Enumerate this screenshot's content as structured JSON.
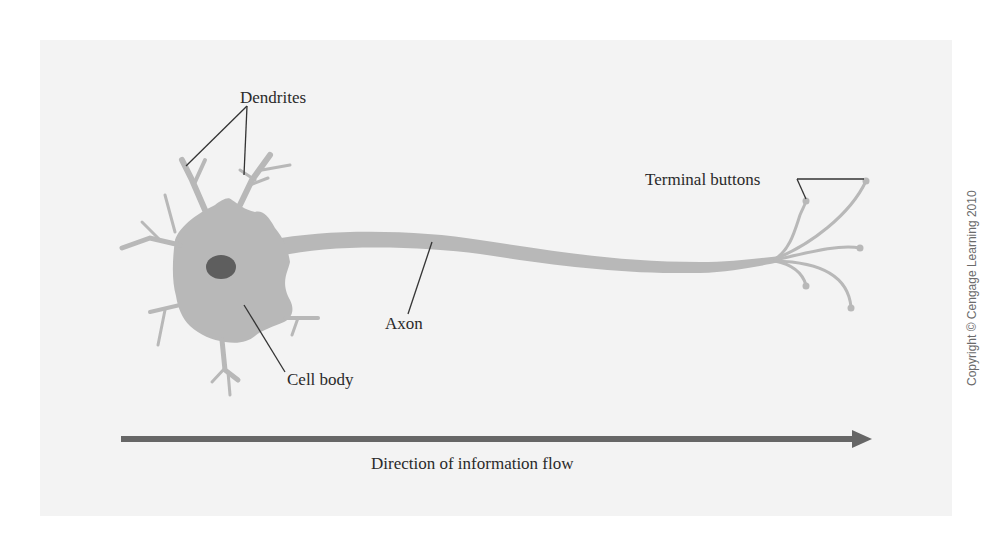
{
  "figure": {
    "labels": {
      "dendrites": "Dendrites",
      "terminal_buttons": "Terminal buttons",
      "axon": "Axon",
      "cell_body": "Cell body",
      "direction": "Direction of information flow"
    },
    "copyright": "Copyright © Cengage Learning 2010",
    "colors": {
      "panel": "#f3f3f3",
      "neuron": "#b8b8b8",
      "nucleus": "#5e5e5e",
      "arrow": "#666666",
      "leader_line": "#333333"
    }
  }
}
